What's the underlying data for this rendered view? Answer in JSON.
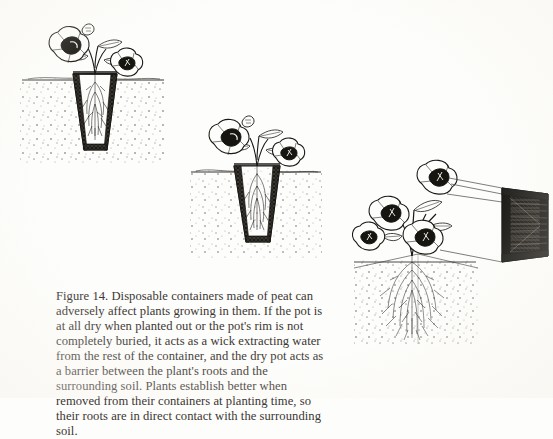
{
  "page": {
    "background_color": "#fdfdfb",
    "text_color": "#3b3733"
  },
  "caption": {
    "label": "Figure 14.",
    "text": "Figure 14. Disposable containers made of peat can adversely affect plants growing in them. If the pot is at all dry when planted out or the pot's rim is not completely buried, it acts as a wick extracting water from the rest of the container, and the dry pot acts as a barrier between the plant's roots and the surrounding soil. Plants establish better when removed from their containers at planting time, so their roots are in direct contact with the surrounding soil."
  },
  "figures": [
    {
      "id": "fig-left",
      "name": "plant-in-peat-pot-buried-shallow",
      "description": "Pen-and-ink drawing of a flowering petunia growing in a tapered peat pot set in soil, with the pot rim protruding above the soil line and roots confined inside the pot.",
      "ink_color": "#1a1815",
      "soil_line_label": "soil surface",
      "elements": [
        "flowers",
        "stems",
        "leaves",
        "peat-pot",
        "confined-roots",
        "soil-stipple"
      ]
    },
    {
      "id": "fig-middle",
      "name": "plant-in-peat-pot-buried",
      "description": "Pen-and-ink drawing of a flowering plant in a peat pot buried in soil, roots restricted within the dark pot walls.",
      "ink_color": "#1a1815",
      "soil_line_label": "soil surface",
      "elements": [
        "flowers",
        "stems",
        "leaves",
        "peat-pot",
        "confined-roots",
        "soil-stipple"
      ]
    },
    {
      "id": "fig-right",
      "name": "plant-removed-from-pot",
      "description": "Pen-and-ink drawing of a flowering plant planted with its roots in direct contact with surrounding soil, with the empty peat pot drawn in perspective to the upper right connected by leader lines.",
      "ink_color": "#1a1815",
      "soil_line_label": "soil surface",
      "elements": [
        "flowers",
        "stems",
        "leaves",
        "free-roots",
        "soil-stipple",
        "empty-peat-pot",
        "leader-lines"
      ]
    }
  ]
}
